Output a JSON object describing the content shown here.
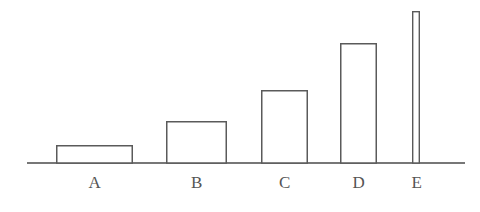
{
  "figure": {
    "background_color": "#ffffff",
    "stroke_color": "#555555",
    "axis_color": "#4a4a4a",
    "baseline_y": 163,
    "axis_x_start": 27,
    "axis_x_end": 465
  },
  "chart_data": {
    "type": "bar",
    "title": "",
    "subtitle": "",
    "xlabel": "",
    "ylabel": "",
    "categories": [
      "A",
      "B",
      "C",
      "D",
      "E"
    ],
    "values": [
      18,
      42,
      73,
      120,
      152
    ],
    "ylim": [
      0,
      160
    ],
    "grid": false,
    "legend": null,
    "annotations": [],
    "bar_style": "outline-only, white fill, thin dark outline",
    "bar_geometry": [
      {
        "label": "A",
        "left": 56,
        "right": 133,
        "top": 145,
        "width": 77,
        "height": 18
      },
      {
        "label": "B",
        "left": 166,
        "right": 227,
        "top": 121,
        "width": 61,
        "height": 42
      },
      {
        "label": "C",
        "left": 261,
        "right": 308,
        "top": 90,
        "width": 47,
        "height": 73
      },
      {
        "label": "D",
        "left": 340,
        "right": 377,
        "top": 43,
        "width": 37,
        "height": 120
      },
      {
        "label": "E",
        "left": 412,
        "right": 420,
        "top": 11,
        "width": 8,
        "height": 152
      }
    ],
    "tick_label_positions": [
      {
        "label": "A",
        "x": 95,
        "y": 174
      },
      {
        "label": "B",
        "x": 197,
        "y": 174
      },
      {
        "label": "C",
        "x": 285,
        "y": 174
      },
      {
        "label": "D",
        "x": 359,
        "y": 174
      },
      {
        "label": "E",
        "x": 417,
        "y": 174
      }
    ]
  }
}
